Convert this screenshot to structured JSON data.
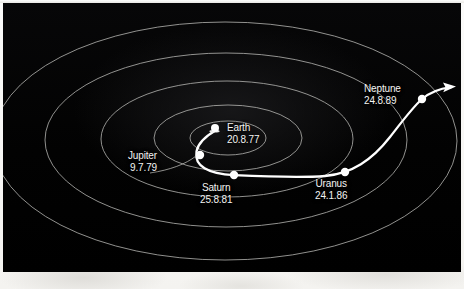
{
  "figure": {
    "background_color": "#030303",
    "paper_color": "#f4f3f0",
    "orbit_color": "#b9b9b6",
    "trajectory_color": "#ffffff",
    "label_color": "#f4f4f2"
  },
  "chart_data": {
    "type": "scatter",
    "title": "",
    "xlabel": "",
    "ylabel": "",
    "projection": "oblique ecliptic plane view, orbits drawn as nested ellipses",
    "grid": false,
    "legend": "none",
    "orbits": [
      {
        "name": "inner-orbit-1",
        "cx": 228,
        "cy": 138,
        "rx": 38,
        "ry": 17
      },
      {
        "name": "inner-orbit-2",
        "cx": 228,
        "cy": 138,
        "rx": 74,
        "ry": 33
      },
      {
        "name": "mid-orbit-3",
        "cx": 227,
        "cy": 139,
        "rx": 126,
        "ry": 58
      },
      {
        "name": "outer-orbit-4",
        "cx": 226,
        "cy": 140,
        "rx": 181,
        "ry": 87
      },
      {
        "name": "outer-orbit-5",
        "cx": 225,
        "cy": 141,
        "rx": 232,
        "ry": 119
      }
    ],
    "markers": [
      {
        "label": "Earth",
        "date": "20.8.77",
        "x": 215,
        "y": 128,
        "r": 4.0,
        "type": "launch"
      },
      {
        "label": "Jupiter",
        "date": "9.7.79",
        "x": 200,
        "y": 155,
        "r": 4.2,
        "type": "flyby"
      },
      {
        "label": "Saturn",
        "date": "25.8.81",
        "x": 234,
        "y": 175,
        "r": 4.2,
        "type": "flyby"
      },
      {
        "label": "Uranus",
        "date": "24.1.86",
        "x": 345,
        "y": 172,
        "r": 4.2,
        "type": "flyby"
      },
      {
        "label": "Neptune",
        "date": "24.8.89",
        "x": 422,
        "y": 99,
        "r": 4.2,
        "type": "flyby"
      }
    ],
    "trajectory": {
      "name": "voyager-2-path",
      "points": "starts at Earth, loops below inner orbits to Jupiter, sweeps right past Saturn, rises through Uranus to Neptune, then escapes with arrow",
      "arrow_tip_x": 456,
      "arrow_tip_y": 87
    }
  },
  "labels": [
    {
      "name": "Earth",
      "date": "20.8.77",
      "align": "left",
      "left": 227,
      "top": 122
    },
    {
      "name": "Jupiter",
      "date": "9.7.79",
      "align": "right",
      "left": 128,
      "top": 150
    },
    {
      "name": "Saturn",
      "date": "25.8.81",
      "align": "center",
      "left": 200,
      "top": 182
    },
    {
      "name": "Uranus",
      "date": "24.1.86",
      "align": "center",
      "left": 315,
      "top": 178
    },
    {
      "name": "Neptune",
      "date": "24.8.89",
      "align": "left",
      "left": 364,
      "top": 83
    }
  ]
}
